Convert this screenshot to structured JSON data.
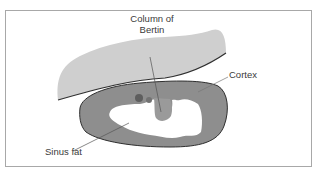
{
  "diagram": {
    "labels": {
      "column_of_bertin_line1": "Column of",
      "column_of_bertin_line2": "Bertin",
      "cortex": "Cortex",
      "sinus_fat": "Sinus fat"
    },
    "colors": {
      "liver": "#cfcfcf",
      "cortex": "#8e8e8e",
      "column": "#9a9a9a",
      "dark_structure": "#5e5e5e",
      "sinus_fat": "#ffffff",
      "outline": "#2f2f2f",
      "leader_line": "#555555",
      "frame": "#a8a8a8"
    }
  }
}
